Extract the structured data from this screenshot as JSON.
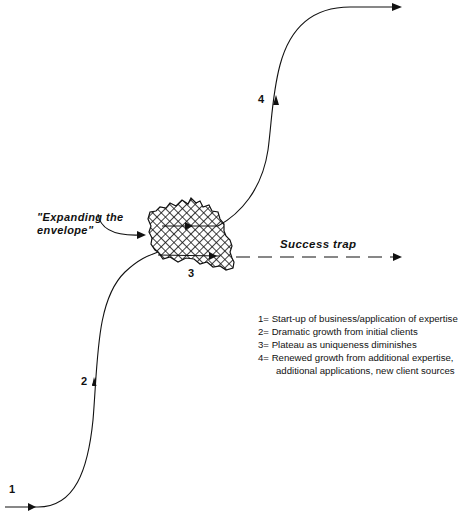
{
  "diagram": {
    "stage_labels": {
      "s1": "1",
      "s2": "2",
      "s3": "3",
      "s4": "4"
    },
    "annotations": {
      "expanding_line1": "\"Expanding the",
      "expanding_line2": "envelope\"",
      "success_trap": "Success trap"
    },
    "legend": [
      {
        "key": "1=",
        "text": "Start-up of business/application of expertise"
      },
      {
        "key": "2=",
        "text": "Dramatic growth from initial clients"
      },
      {
        "key": "3=",
        "text": "Plateau as uniqueness diminishes"
      },
      {
        "key": "4=",
        "text": "Renewed growth from additional expertise,"
      },
      {
        "key": "",
        "text": "additional applications, new client sources"
      }
    ],
    "colors": {
      "ink": "#111111",
      "background": "#ffffff"
    }
  }
}
